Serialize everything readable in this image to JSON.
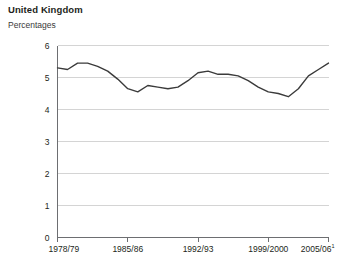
{
  "header": {
    "title": "United Kingdom",
    "subtitle": "Percentages"
  },
  "chart_data": {
    "type": "line",
    "title": "United Kingdom",
    "subtitle": "Percentages",
    "xlabel": "",
    "ylabel": "Percentages",
    "ylim": [
      0,
      6
    ],
    "xlim": [
      "1978/79",
      "2005/06"
    ],
    "grid": true,
    "legend": false,
    "y_ticks": [
      "0",
      "1",
      "2",
      "3",
      "4",
      "5",
      "6"
    ],
    "y_tick_values": [
      0,
      1,
      2,
      3,
      4,
      5,
      6
    ],
    "x_tick_labels": [
      "1978/79",
      "1985/86",
      "1992/93",
      "1999/2000",
      "2005/06"
    ],
    "x_tick_footnote": "1",
    "x_tick_indices": [
      0,
      7,
      14,
      21,
      27
    ],
    "line_color": "#3b3b3b",
    "grid_color": "#d4d4d4",
    "axis_color": "#6d6e71",
    "categories": [
      "1978/79",
      "1979/80",
      "1980/81",
      "1981/82",
      "1982/83",
      "1983/84",
      "1984/85",
      "1985/86",
      "1986/87",
      "1987/88",
      "1988/89",
      "1989/90",
      "1990/91",
      "1991/92",
      "1992/93",
      "1993/94",
      "1994/95",
      "1995/96",
      "1996/97",
      "1997/98",
      "1998/99",
      "1999/2000",
      "2000/01",
      "2001/02",
      "2002/03",
      "2003/04",
      "2004/05",
      "2005/06"
    ],
    "series": [
      {
        "name": "United Kingdom",
        "values": [
          5.3,
          5.25,
          5.45,
          5.45,
          5.35,
          5.2,
          4.95,
          4.65,
          4.55,
          4.75,
          4.7,
          4.65,
          4.7,
          4.9,
          5.15,
          5.2,
          5.1,
          5.1,
          5.05,
          4.9,
          4.7,
          4.55,
          4.5,
          4.4,
          4.65,
          5.05,
          5.25,
          5.45
        ]
      }
    ]
  }
}
